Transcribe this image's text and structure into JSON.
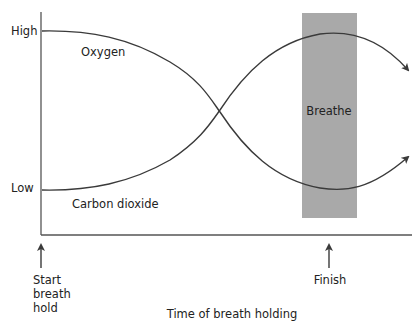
{
  "diagram": {
    "title": "",
    "y_axis": {
      "high_label": "High",
      "low_label": "Low"
    },
    "x_axis": {
      "label": "Time of breath holding"
    },
    "curves": [
      {
        "name": "Oxygen",
        "label": "Oxygen",
        "trend": "starts high, falls during breath hold, rises again after breathing"
      },
      {
        "name": "Carbon dioxide",
        "label": "Carbon dioxide",
        "trend": "starts low, rises during breath hold, falls again after breathing"
      }
    ],
    "breathe_region": {
      "label": "Breathe",
      "color": "#a9a9a9"
    },
    "markers": [
      {
        "label_lines": [
          "Start",
          "breath",
          "hold"
        ]
      },
      {
        "label_lines": [
          "Finish"
        ]
      }
    ],
    "colors": {
      "line": "#3a3a3a",
      "axis": "#555555",
      "band": "#a9a9a9"
    }
  }
}
